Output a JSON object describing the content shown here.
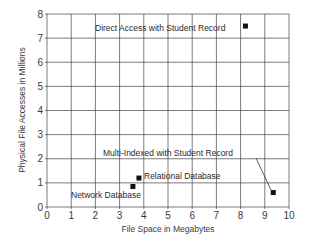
{
  "chart_data": {
    "type": "scatter",
    "title": "",
    "xlabel": "File Space in Megabytes",
    "ylabel": "Physical File Accesses in Millions",
    "xlim": [
      0,
      10
    ],
    "ylim": [
      0,
      8
    ],
    "x_ticks": [
      0,
      1,
      2,
      3,
      4,
      5,
      6,
      7,
      8,
      9,
      10
    ],
    "y_ticks": [
      0,
      1,
      2,
      3,
      4,
      5,
      6,
      7,
      8
    ],
    "grid": true,
    "legend": "none",
    "points": [
      {
        "label": "Direct Access with Student Record",
        "x": 8.2,
        "y": 7.5
      },
      {
        "label": "Multi-Indexed with Student Record",
        "x": 9.35,
        "y": 0.6
      },
      {
        "label": "Relational Database",
        "x": 3.8,
        "y": 1.2
      },
      {
        "label": "Network Database",
        "x": 3.55,
        "y": 0.85
      }
    ]
  },
  "labels": {
    "xlabel": "File Space in Megabytes",
    "ylabel": "Physical File Accesses in Millions",
    "direct": "Direct Access with Student Record",
    "multi": "Multi-Indexed with Student Record",
    "relational": "Relational Database",
    "network": "Network Database"
  },
  "colors": {
    "grid": "#444444",
    "marker": "#111111",
    "text": "#2a2a2a"
  }
}
